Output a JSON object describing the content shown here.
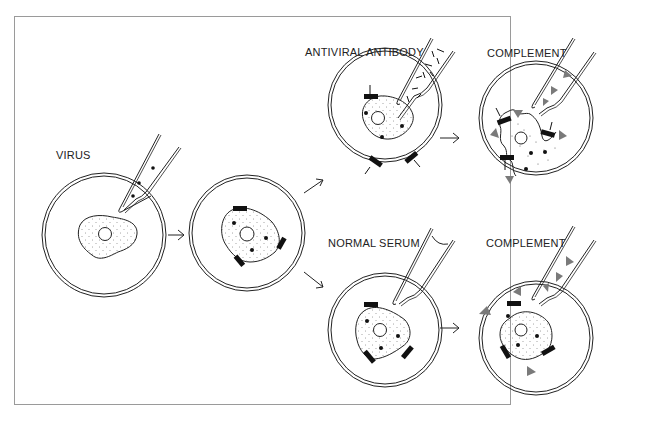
{
  "diagram": {
    "title": "",
    "labels": {
      "virus": "VIRUS",
      "antiviral_antibody": "ANTIVIRAL ANTIBODY",
      "complement_top": "COMPLEMENT",
      "normal_serum": "NORMAL SERUM",
      "complement_bottom": "COMPLEMENT"
    },
    "steps": [
      {
        "id": "dish-1",
        "description": "Cell in dish; pipette adds virus"
      },
      {
        "id": "dish-2",
        "description": "Infected cell expressing viral antigens on surface"
      },
      {
        "id": "dish-3",
        "description": "Antiviral antibody added; antibodies bind surface antigens"
      },
      {
        "id": "dish-4",
        "description": "Complement added; cell lysed"
      },
      {
        "id": "dish-5",
        "description": "Normal serum added; no antibody binding"
      },
      {
        "id": "dish-6",
        "description": "Complement added; cell remains intact"
      }
    ],
    "colors": {
      "stroke": "#222222",
      "complement": "#7a7a7a",
      "frame": "#9a9a9a",
      "antigen": "#111111"
    }
  }
}
